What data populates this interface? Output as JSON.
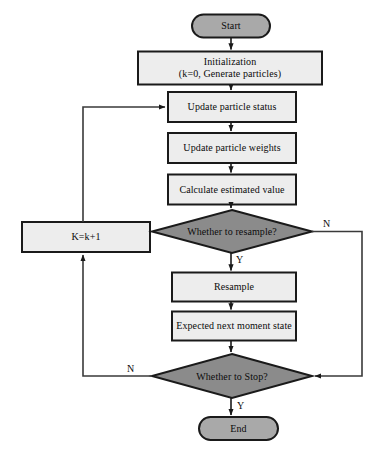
{
  "diagram": {
    "colors": {
      "terminator_fill": "#a9a9a9",
      "decision_fill": "#8b8b8b",
      "process_fill": "#ededed",
      "stroke": "#1a1a1a",
      "line": "#3a3a3a",
      "text": "#0b0b0b",
      "background": "#ffffff"
    },
    "nodes": [
      {
        "id": "start",
        "shape": "terminator",
        "label": "Start"
      },
      {
        "id": "init",
        "shape": "process",
        "label": "Initialization\n(k=0, Generate particles)"
      },
      {
        "id": "update_status",
        "shape": "process",
        "label": "Update particle status"
      },
      {
        "id": "update_weights",
        "shape": "process",
        "label": "Update particle weights"
      },
      {
        "id": "calc_value",
        "shape": "process",
        "label": "Calculate estimated value"
      },
      {
        "id": "increment",
        "shape": "process",
        "label": "K=k+1"
      },
      {
        "id": "resample_q",
        "shape": "decision",
        "label": "Whether to resample?"
      },
      {
        "id": "resample",
        "shape": "process",
        "label": "Resample"
      },
      {
        "id": "expected",
        "shape": "process",
        "label": "Expected next moment state"
      },
      {
        "id": "stop_q",
        "shape": "decision",
        "label": "Whether to Stop?"
      },
      {
        "id": "end",
        "shape": "terminator",
        "label": "End"
      }
    ],
    "edge_labels": {
      "resample_yes": "Y",
      "resample_no": "N",
      "stop_yes": "Y",
      "stop_no": "N"
    }
  }
}
